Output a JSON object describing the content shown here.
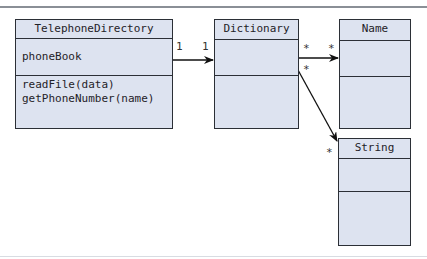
{
  "diagram": {
    "type": "uml-class-diagram",
    "classes": [
      {
        "name": "TelephoneDirectory",
        "attributes": [
          "phoneBook"
        ],
        "methods": [
          "readFile(data)",
          "getPhoneNumber(name)"
        ]
      },
      {
        "name": "Dictionary",
        "attributes": [],
        "methods": []
      },
      {
        "name": "Name",
        "attributes": [],
        "methods": []
      },
      {
        "name": "String",
        "attributes": [],
        "methods": []
      }
    ],
    "associations": [
      {
        "from": "TelephoneDirectory",
        "to": "Dictionary",
        "source_multiplicity": "1",
        "target_multiplicity": "1",
        "navigable": true
      },
      {
        "from": "Dictionary",
        "to": "Name",
        "source_multiplicity": "*",
        "target_multiplicity": "*",
        "navigable": true
      },
      {
        "from": "Dictionary",
        "to": "String",
        "source_multiplicity": "*",
        "target_multiplicity": "*",
        "navigable": true
      }
    ],
    "colors": {
      "box_fill": "#dde3f0",
      "border": "#2b2f36",
      "text": "#1f2228"
    }
  }
}
